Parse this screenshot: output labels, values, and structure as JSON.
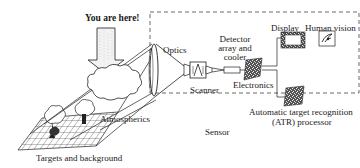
{
  "diagram": {
    "callout": "You are here!",
    "labels": {
      "optics": "Optics",
      "scanner": "Scanner",
      "detector_line1": "Detector",
      "detector_line2": "array and",
      "detector_line3": "cooler",
      "electronics": "Electronics",
      "display": "Display",
      "human_vision": "Human vision",
      "atr_line1": "Automatic target recognition",
      "atr_line2": "(ATR) processor",
      "atmospherics": "Atmospherics",
      "sensor": "Sensor",
      "targets": "Targets and background"
    },
    "flow": [
      "Targets and background",
      "Atmospherics",
      "Optics",
      "Scanner",
      "Detector array and cooler",
      "Electronics",
      "Display",
      "Human vision",
      "Automatic target recognition (ATR) processor"
    ],
    "colors": {
      "line": "#222222",
      "arrow_fill": "#f2f2f2",
      "box_dash": "#444444"
    }
  }
}
